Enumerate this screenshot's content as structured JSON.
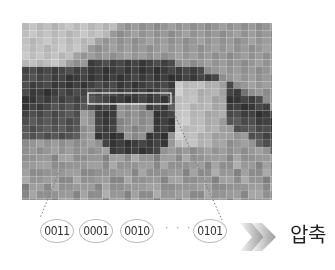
{
  "diagram": {
    "image_description": "pixelated grayscale eye image with grid",
    "highlight_region": "selected row of pixels",
    "bit_codes": [
      "0011",
      "0001",
      "0010",
      "0101"
    ],
    "ellipsis": "· · ·",
    "arrow_icon": "double-chevron-arrow-icon",
    "result_label": "압축"
  }
}
